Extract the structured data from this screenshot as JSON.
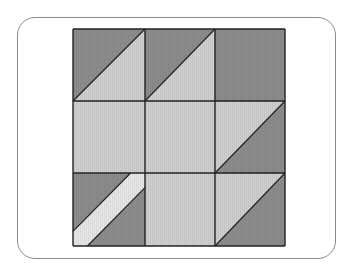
{
  "diagram": {
    "type": "quilt-block",
    "colors": {
      "dark": "#8c8c8c",
      "light": "#cfcfcf",
      "stripe": "#e6e6e6",
      "line": "#222222",
      "frame": "#8a8a8a"
    },
    "grid": {
      "rows": 3,
      "cols": 3
    },
    "blocks": [
      {
        "row": 0,
        "col": 0,
        "kind": "half-square",
        "upper": "dark",
        "lower": "light",
        "diagonal": "rising"
      },
      {
        "row": 0,
        "col": 1,
        "kind": "half-square",
        "upper": "dark",
        "lower": "light",
        "diagonal": "rising"
      },
      {
        "row": 0,
        "col": 2,
        "kind": "solid",
        "fill": "dark"
      },
      {
        "row": 1,
        "col": 0,
        "kind": "solid",
        "fill": "light"
      },
      {
        "row": 1,
        "col": 1,
        "kind": "solid",
        "fill": "light"
      },
      {
        "row": 1,
        "col": 2,
        "kind": "half-square",
        "upper": "light",
        "lower": "dark",
        "diagonal": "rising"
      },
      {
        "row": 2,
        "col": 0,
        "kind": "stripe",
        "fill": "dark",
        "stripe": "stripe",
        "diagonal": "rising"
      },
      {
        "row": 2,
        "col": 1,
        "kind": "solid",
        "fill": "light"
      },
      {
        "row": 2,
        "col": 2,
        "kind": "half-square",
        "upper": "light",
        "lower": "dark",
        "diagonal": "rising"
      }
    ]
  }
}
